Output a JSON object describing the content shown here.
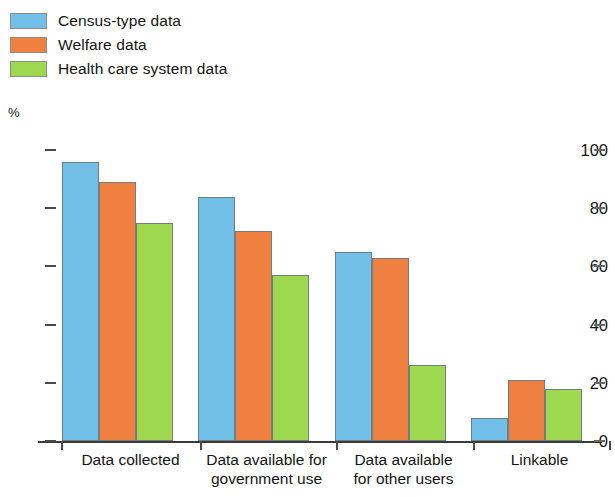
{
  "chart_data": {
    "type": "bar",
    "title": "",
    "subtitle": "",
    "xlabel": "",
    "ylabel": "%",
    "ylim": [
      0,
      100
    ],
    "ytick_labels": [
      "0",
      "20",
      "40",
      "60",
      "80",
      "100"
    ],
    "ytick_values": [
      0,
      20,
      40,
      60,
      80,
      100
    ],
    "grid": false,
    "legend_position": "top-left",
    "categories": [
      "Data collected",
      "Data available for\ngovernment use",
      "Data available\nfor other users",
      "Linkable"
    ],
    "category_lines": [
      [
        "Data collected"
      ],
      [
        "Data available for",
        "government use"
      ],
      [
        "Data available",
        "for other users"
      ],
      [
        "Linkable"
      ]
    ],
    "series": [
      {
        "name": "Census-type data",
        "color": "#72c0e8",
        "values": [
          96,
          84,
          65,
          8
        ]
      },
      {
        "name": "Welfare data",
        "color": "#ef8040",
        "values": [
          89,
          72,
          63,
          21
        ]
      },
      {
        "name": "Health care system data",
        "color": "#9ed84e",
        "values": [
          75,
          57,
          26,
          18
        ]
      }
    ]
  },
  "legend": {
    "items": [
      {
        "label": "Census-type data",
        "color": "#72c0e8"
      },
      {
        "label": "Welfare data",
        "color": "#ef8040"
      },
      {
        "label": "Health care system data",
        "color": "#9ed84e"
      }
    ]
  },
  "axis": {
    "y_unit": "%",
    "y_labels": [
      "100",
      "80",
      "60",
      "40",
      "20",
      "0"
    ]
  }
}
